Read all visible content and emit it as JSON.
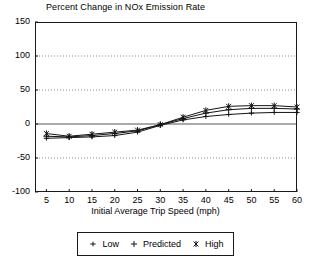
{
  "chart_data": {
    "type": "line",
    "title": "Percent Change in NOx Emission Rate",
    "xlabel": "Initial Average Trip Speed (mph)",
    "ylabel": "",
    "x": [
      5,
      10,
      15,
      20,
      25,
      30,
      35,
      40,
      45,
      50,
      55,
      60
    ],
    "xlim": [
      2.5,
      60
    ],
    "ylim": [
      -100,
      150
    ],
    "xticks": [
      5,
      10,
      15,
      20,
      25,
      30,
      35,
      40,
      45,
      50,
      55,
      60
    ],
    "yticks": [
      -100,
      -50,
      0,
      50,
      100,
      150
    ],
    "grid": "horizontal-dotted",
    "zero_line": true,
    "legend_position": "below",
    "series": [
      {
        "name": "Low",
        "marker": "plus-small",
        "values": [
          -21,
          -20,
          -19,
          -17,
          -12,
          -2,
          6,
          11,
          14,
          16,
          17,
          17
        ]
      },
      {
        "name": "Predicted",
        "marker": "plus",
        "values": [
          -18,
          -19,
          -17,
          -14,
          -10,
          -1,
          8,
          16,
          21,
          23,
          23,
          22
        ]
      },
      {
        "name": "High",
        "marker": "asterisk",
        "values": [
          -14,
          -18,
          -15,
          -12,
          -9,
          -1,
          10,
          20,
          26,
          27,
          27,
          25
        ]
      }
    ]
  },
  "axes": {
    "y_tick_labels": [
      "150",
      "100",
      "50",
      "0",
      "-50",
      "-100"
    ],
    "x_tick_labels": [
      "5",
      "10",
      "15",
      "20",
      "25",
      "30",
      "35",
      "40",
      "45",
      "50",
      "55",
      "60"
    ]
  },
  "legend": {
    "items": [
      {
        "label": "Low"
      },
      {
        "label": "Predicted"
      },
      {
        "label": "High"
      }
    ]
  },
  "colors": {
    "line": "#141414",
    "frame": "#1a1a1a",
    "grid": "#8c8c8c",
    "background": "#ffffff",
    "text": "#000000"
  }
}
